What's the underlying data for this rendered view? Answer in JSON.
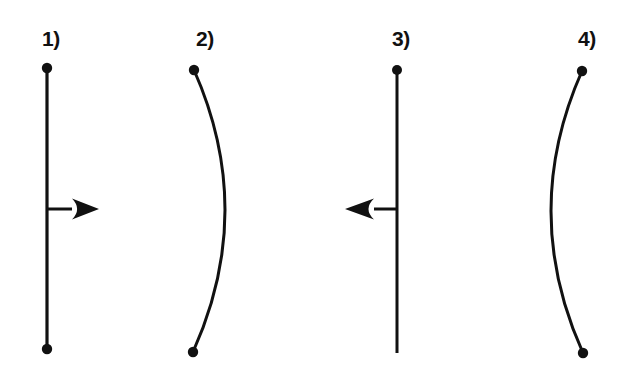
{
  "figure": {
    "background_color": "#ffffff",
    "ink_color": "#111111",
    "width": 630,
    "height": 365,
    "panels": [
      {
        "id": "panel-1",
        "label": "1)",
        "label_x": 42,
        "label_y": 46,
        "shape": "straight-line",
        "curve_direction": "none",
        "line_x": 47,
        "line_top_y": 68,
        "line_bottom_y": 349,
        "line_width": 3.2,
        "dot_top": true,
        "dot_bottom": true,
        "dot_radius": 5.2,
        "arrow": true,
        "arrow_direction": "right",
        "arrow_y": 209,
        "arrow_shaft_start_x": 47,
        "arrow_shaft_end_x": 72,
        "arrow_tip_x": 99,
        "arrow_shaft_width": 3.0
      },
      {
        "id": "panel-2",
        "label": "2)",
        "label_x": 196,
        "label_y": 46,
        "shape": "curve",
        "curve_direction": "bulge-right",
        "curve_start_x": 194,
        "curve_start_y": 70,
        "curve_end_x": 193,
        "curve_end_y": 352,
        "curve_apex_x": 225,
        "line_width": 3.0,
        "dot_top": true,
        "dot_bottom": true,
        "dot_radius": 5.2,
        "arrow": false,
        "arrow_direction": "none"
      },
      {
        "id": "panel-3",
        "label": "3)",
        "label_x": 392,
        "label_y": 46,
        "shape": "straight-line",
        "curve_direction": "none",
        "line_x": 397,
        "line_top_y": 70,
        "line_bottom_y": 353,
        "line_width": 3.0,
        "dot_top": true,
        "dot_bottom": false,
        "dot_radius": 5.0,
        "arrow": true,
        "arrow_direction": "left",
        "arrow_y": 209,
        "arrow_shaft_start_x": 397,
        "arrow_shaft_end_x": 374,
        "arrow_tip_x": 345,
        "arrow_shaft_width": 3.0
      },
      {
        "id": "panel-4",
        "label": "4)",
        "label_x": 578,
        "label_y": 46,
        "shape": "curve",
        "curve_direction": "bulge-left",
        "curve_start_x": 582,
        "curve_start_y": 71,
        "curve_end_x": 583,
        "curve_end_y": 353,
        "curve_apex_x": 551,
        "line_width": 3.0,
        "dot_top": true,
        "dot_bottom": true,
        "dot_radius": 5.2,
        "arrow": false,
        "arrow_direction": "none"
      }
    ]
  }
}
